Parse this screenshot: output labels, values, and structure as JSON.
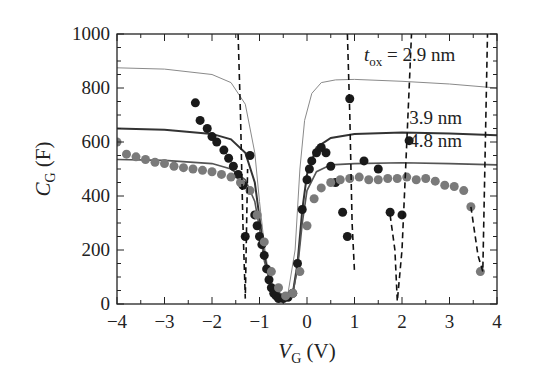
{
  "chart_data": {
    "type": "scatter",
    "title": "",
    "xlabel": "V_G (V)",
    "ylabel": "C_G (F)",
    "xlim": [
      -4,
      4
    ],
    "ylim": [
      0,
      1000
    ],
    "xticks": [
      "−4",
      "−3",
      "−2",
      "−1",
      "0",
      "1",
      "2",
      "3",
      "4"
    ],
    "yticks": [
      "0",
      "200",
      "400",
      "600",
      "800",
      "1000"
    ],
    "grid": false,
    "annotations": [
      {
        "text": "2.9 nm",
        "prefix": "t",
        "sub": "ox",
        "eq": " = ",
        "x": 1.2,
        "y": 900
      },
      {
        "text": "3.9 nm",
        "x": 2.15,
        "y": 665
      },
      {
        "text": "4.8 nm",
        "x": 2.15,
        "y": 580
      }
    ],
    "series": [
      {
        "name": "model 2.9 nm",
        "style": "thin-gray-line",
        "x": [
          -4,
          -3,
          -2,
          -1.6,
          -1.3,
          -1.1,
          -1.0,
          -0.9,
          -0.8,
          -0.6,
          -0.4,
          -0.25,
          -0.15,
          -0.05,
          0.1,
          0.3,
          0.6,
          1,
          2,
          3,
          4
        ],
        "y": [
          875,
          870,
          850,
          820,
          740,
          560,
          380,
          220,
          100,
          30,
          40,
          200,
          500,
          680,
          780,
          820,
          830,
          832,
          825,
          815,
          800
        ]
      },
      {
        "name": "model 3.9 nm",
        "style": "dark-line",
        "x": [
          -4,
          -3,
          -2,
          -1.6,
          -1.3,
          -1.1,
          -1.0,
          -0.9,
          -0.75,
          -0.5,
          -0.3,
          -0.2,
          -0.1,
          0,
          0.2,
          0.5,
          1,
          2,
          3,
          4
        ],
        "y": [
          650,
          645,
          630,
          610,
          560,
          450,
          320,
          180,
          60,
          30,
          40,
          150,
          350,
          480,
          580,
          615,
          630,
          635,
          632,
          625
        ]
      },
      {
        "name": "model 4.8 nm",
        "style": "gray-line",
        "x": [
          -4,
          -3,
          -2,
          -1.6,
          -1.3,
          -1.1,
          -1.0,
          -0.9,
          -0.75,
          -0.5,
          -0.3,
          -0.2,
          -0.1,
          0,
          0.2,
          0.5,
          1,
          2,
          3,
          4
        ],
        "y": [
          535,
          532,
          520,
          500,
          460,
          380,
          280,
          160,
          60,
          30,
          40,
          130,
          300,
          420,
          490,
          515,
          520,
          523,
          520,
          515
        ]
      },
      {
        "name": "data black",
        "style": "black-dots",
        "x": [
          -2.35,
          -2.25,
          -2.1,
          -2.0,
          -1.9,
          -1.75,
          -1.65,
          -1.55,
          -1.45,
          -1.35,
          -1.3,
          -1.2,
          -1.1,
          -1.05,
          -1.0,
          -0.95,
          -0.9,
          -0.85,
          -0.8,
          -0.75,
          -0.7,
          -0.65,
          -0.6,
          -0.5,
          -0.4,
          -0.3,
          -0.2,
          -0.1,
          0,
          0.05,
          0.1,
          0.2,
          0.3,
          0.4,
          0.5,
          0.6,
          0.75,
          0.85,
          0.9,
          1.2,
          1.5,
          1.75,
          2.0,
          2.15
        ],
        "y": [
          745,
          680,
          650,
          620,
          600,
          570,
          540,
          510,
          480,
          440,
          250,
          550,
          330,
          290,
          250,
          220,
          180,
          130,
          90,
          60,
          40,
          30,
          20,
          20,
          25,
          40,
          150,
          350,
          460,
          500,
          530,
          560,
          580,
          560,
          510,
          450,
          340,
          250,
          760,
          530,
          500,
          340,
          330,
          605
        ]
      },
      {
        "name": "data gray",
        "style": "gray-dots",
        "x": [
          -4,
          -3.8,
          -3.6,
          -3.4,
          -3.2,
          -3.0,
          -2.8,
          -2.6,
          -2.4,
          -2.2,
          -2.0,
          -1.8,
          -1.6,
          -1.4,
          -1.2,
          -1.05,
          -0.9,
          -0.75,
          -0.6,
          -0.45,
          -0.3,
          -0.15,
          0,
          0.15,
          0.3,
          0.5,
          0.7,
          0.9,
          1.1,
          1.3,
          1.5,
          1.7,
          1.9,
          2.1,
          2.3,
          2.5,
          2.7,
          2.9,
          3.1,
          3.3,
          3.45,
          3.65
        ],
        "y": [
          600,
          555,
          545,
          535,
          525,
          520,
          510,
          505,
          500,
          495,
          490,
          480,
          470,
          450,
          420,
          330,
          230,
          120,
          60,
          30,
          40,
          120,
          290,
          390,
          430,
          450,
          460,
          465,
          470,
          460,
          460,
          465,
          465,
          470,
          460,
          465,
          455,
          440,
          435,
          420,
          360,
          120
        ]
      },
      {
        "name": "dashed (black data)",
        "style": "black-dashed",
        "x": [
          -1.45,
          -1.4,
          -1.35,
          -1.3,
          -1.25,
          null,
          0.85,
          0.9,
          0.95,
          1.0,
          null,
          1.75,
          1.85,
          1.9,
          2.0,
          2.1,
          2.2,
          null,
          3.45,
          3.6,
          3.7,
          3.8
        ],
        "y": [
          1000,
          700,
          300,
          20,
          500,
          null,
          1000,
          700,
          300,
          120,
          null,
          330,
          200,
          10,
          200,
          600,
          1000,
          null,
          360,
          180,
          120,
          1000
        ]
      }
    ]
  }
}
